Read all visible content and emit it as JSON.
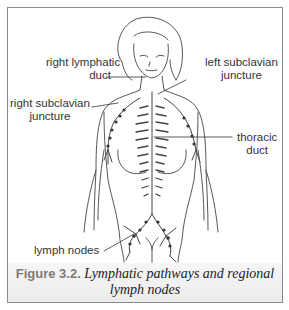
{
  "figure": {
    "labels": {
      "right_lymphatic_duct_line1": "right lymphatic",
      "right_lymphatic_duct_line2": "duct",
      "left_subclavian_line1": "left subclavian",
      "left_subclavian_line2": "juncture",
      "right_subclavian_line1": "right subclavian",
      "right_subclavian_line2": "juncture",
      "thoracic_duct_line1": "thoracic",
      "thoracic_duct_line2": "duct",
      "lymph_nodes": "lymph nodes"
    },
    "caption": {
      "number": "Figure 3.2.",
      "text_line1": " Lymphatic pathways and regional",
      "text_line2": "lymph nodes"
    },
    "colors": {
      "line": "#444444",
      "frame": "#8a8a8a",
      "caption_band": "#efefef",
      "caption_number": "#7a7a7a"
    }
  }
}
